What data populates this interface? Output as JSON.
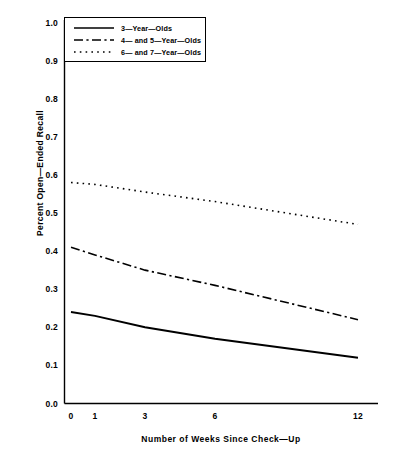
{
  "chart_data": {
    "type": "line",
    "title": "",
    "xlabel": "Number of Weeks Since Check—Up",
    "ylabel": "Percent Open—Ended Recall",
    "x": [
      0,
      1,
      3,
      6,
      12
    ],
    "x_tick_labels": [
      "0",
      "1",
      "3",
      "6",
      "12"
    ],
    "y_tick_labels": [
      "0.0",
      "0.1",
      "0.2",
      "0.3",
      "0.4",
      "0.5",
      "0.6",
      "0.7",
      "0.8",
      "0.9",
      "1.0"
    ],
    "ylim": [
      0.0,
      1.0
    ],
    "grid": false,
    "legend_position": "upper-left-inside",
    "series": [
      {
        "name": "3—Year—Olds",
        "style": "solid",
        "color": "#000000",
        "values": [
          0.24,
          0.23,
          0.2,
          0.17,
          0.12
        ],
        "endpoints": [
          0.24,
          0.12
        ]
      },
      {
        "name": "4—  and  5—Year—Olds",
        "style": "dash-dot",
        "color": "#000000",
        "values": [
          0.41,
          0.39,
          0.35,
          0.31,
          0.22
        ],
        "endpoints": [
          0.41,
          0.22
        ]
      },
      {
        "name": "6—  and  7—Year—Olds",
        "style": "dotted",
        "color": "#000000",
        "values": [
          0.58,
          0.575,
          0.555,
          0.53,
          0.47
        ],
        "endpoints": [
          0.58,
          0.47
        ]
      }
    ]
  },
  "axes": {
    "y_title": "Percent Open—Ended Recall",
    "x_title": "Number of Weeks Since Check—Up",
    "y_ticks": [
      "1.0",
      "0.9",
      "0.8",
      "0.7",
      "0.6",
      "0.5",
      "0.4",
      "0.3",
      "0.2",
      "0.1",
      "0.0"
    ],
    "x_ticks": [
      "0",
      "1",
      "3",
      "6",
      "12"
    ]
  },
  "legend": {
    "entries": [
      {
        "label": "3—Year—Olds",
        "style": "solid"
      },
      {
        "label": "4—  and  5—Year—Olds",
        "style": "dash-dot"
      },
      {
        "label": "6—  and  7—Year—Olds",
        "style": "dotted"
      }
    ]
  }
}
